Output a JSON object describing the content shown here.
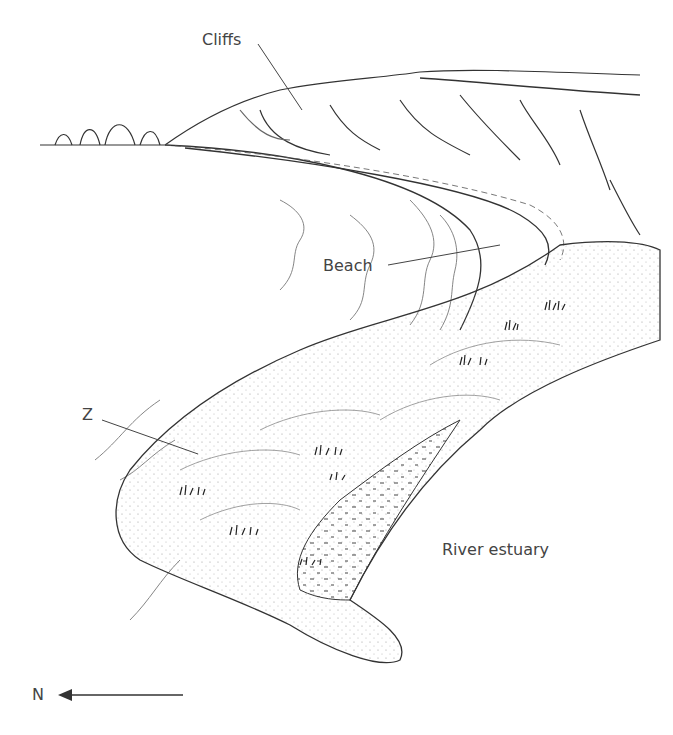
{
  "diagram": {
    "labels": {
      "cliffs": "Cliffs",
      "beach": "Beach",
      "z": "Z",
      "river_estuary": "River estuary",
      "north": "N"
    },
    "colors": {
      "ink": "#333333",
      "label": "#444444",
      "background": "#ffffff",
      "stipple": "#888888"
    }
  }
}
